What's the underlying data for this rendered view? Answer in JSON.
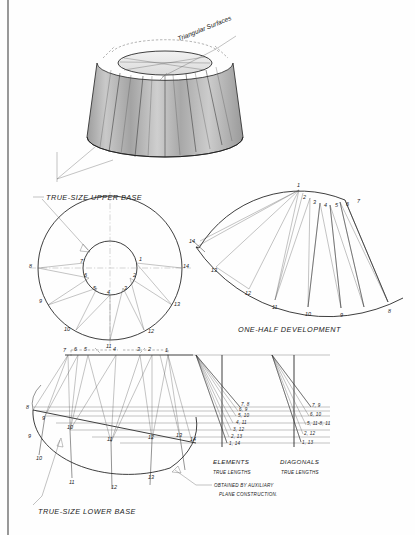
{
  "sheet": {
    "title_note": "Triangular Surfaces",
    "background_color": "#fefefe",
    "ink_color": "#1c1c1c"
  },
  "pictorial": {
    "name": "truncated-cone-pictorial",
    "callout": "Triangular Surfaces"
  },
  "upper_base": {
    "caption": "TRUE-SIZE  UPPER BASE",
    "inner_points": [
      "1",
      "2",
      "3",
      "4",
      "5",
      "6",
      "7"
    ],
    "outer_points": [
      "8",
      "9",
      "10",
      "11",
      "12",
      "13",
      "14"
    ]
  },
  "development": {
    "caption": "ONE-HALF DEVELOPMENT",
    "inner_arc_points": [
      "1",
      "2",
      "3",
      "4",
      "5",
      "6",
      "7"
    ],
    "outer_arc_points": [
      "14",
      "13",
      "12",
      "11",
      "10",
      "9",
      "8"
    ]
  },
  "lower_base": {
    "caption": "TRUE-SIZE  LOWER BASE",
    "top_edge_points": [
      "7",
      "6",
      "5",
      "4",
      "3",
      "2",
      "1"
    ],
    "arc_points": [
      "8",
      "9",
      "10",
      "11",
      "12",
      "13",
      "14"
    ]
  },
  "elements_diagram": {
    "caption_line1": "ELEMENTS",
    "caption_line2": "TRUE LENGTHS",
    "labels": [
      "7, 8",
      "6, 9",
      "5, 10",
      "4, 11",
      "3, 12",
      "2, 13",
      "1, 14"
    ]
  },
  "diagonals_diagram": {
    "caption_line1": "DIAGONALS",
    "caption_line2": "TRUE LENGTHS",
    "labels": [
      "7, 9",
      "6, 10",
      "5, 11-8, 11",
      "2, 12",
      "1, 13"
    ]
  },
  "note": {
    "line1": "OBTAINED BY AUXILIARY",
    "line2": "PLANE CONSTRUCTION."
  }
}
